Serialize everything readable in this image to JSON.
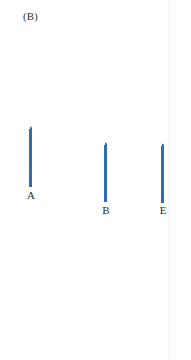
{
  "figure": {
    "panel_label": "(B)",
    "bar_color": "#2c6db5",
    "bars": [
      {
        "label": "A",
        "left": 29,
        "top": 129,
        "height": 58,
        "label_top": 189
      },
      {
        "label": "B",
        "left": 104,
        "top": 145,
        "height": 57,
        "label_top": 204
      },
      {
        "label": "E",
        "left": 161,
        "top": 146,
        "height": 57,
        "label_top": 204
      }
    ]
  }
}
